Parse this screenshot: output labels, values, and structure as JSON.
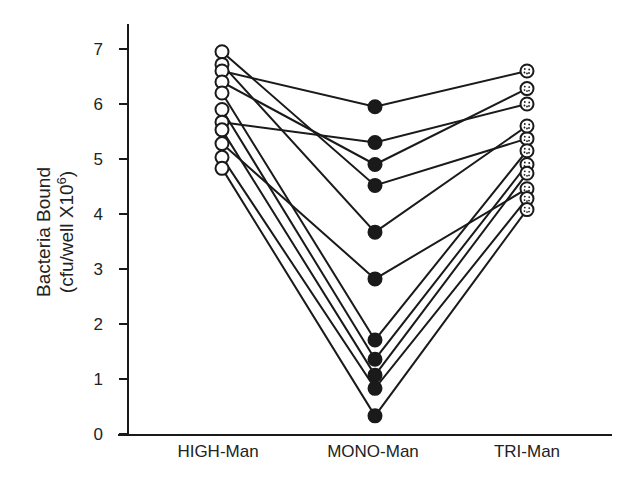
{
  "chart_data": {
    "type": "line",
    "subtype": "paired-dot / before-after",
    "title": "",
    "xlabel": "",
    "ylabel": "Bacteria Bound (cfu/well X10^6)",
    "ylabel_lines": [
      "Bacteria Bound",
      "(cfu/well X10",
      "6",
      ")"
    ],
    "categories": [
      "HIGH-Man",
      "MONO-Man",
      "TRI-Man"
    ],
    "ylim": [
      0,
      7
    ],
    "yticks": [
      0,
      1,
      2,
      3,
      4,
      5,
      6,
      7
    ],
    "grid": false,
    "legend": null,
    "markers": {
      "HIGH-Man": "open-circle",
      "MONO-Man": "filled-circle",
      "TRI-Man": "dotted-circle"
    },
    "series": [
      {
        "name": "sample-1",
        "values": [
          6.95,
          4.52,
          5.37
        ]
      },
      {
        "name": "sample-2",
        "values": [
          6.72,
          3.67,
          5.6
        ]
      },
      {
        "name": "sample-3",
        "values": [
          6.6,
          5.95,
          6.6
        ]
      },
      {
        "name": "sample-4",
        "values": [
          6.4,
          4.9,
          6.28
        ]
      },
      {
        "name": "sample-5",
        "values": [
          6.2,
          1.71,
          5.15
        ]
      },
      {
        "name": "sample-6",
        "values": [
          5.9,
          1.36,
          4.9
        ]
      },
      {
        "name": "sample-7",
        "values": [
          5.67,
          5.3,
          6.0
        ]
      },
      {
        "name": "sample-8",
        "values": [
          5.53,
          1.07,
          4.74
        ]
      },
      {
        "name": "sample-9",
        "values": [
          5.28,
          2.82,
          4.46
        ]
      },
      {
        "name": "sample-10",
        "values": [
          5.03,
          0.83,
          4.28
        ]
      },
      {
        "name": "sample-11",
        "values": [
          4.83,
          0.33,
          4.08
        ]
      }
    ]
  },
  "axis": {
    "y_tick_labels": [
      "0",
      "1",
      "2",
      "3",
      "4",
      "5",
      "6",
      "7"
    ],
    "x_category_labels": [
      "HIGH-Man",
      "MONO-Man",
      "TRI-Man"
    ],
    "y_title_line1": "Bacteria Bound",
    "y_title_line2_prefix": "(cfu/well X10",
    "y_title_line2_sup": "6",
    "y_title_line2_suffix": ")"
  },
  "colors": {
    "ink": "#1a1a1a",
    "background": "#ffffff",
    "open_marker_fill": "#ffffff",
    "filled_marker_fill": "#1a1a1a"
  }
}
